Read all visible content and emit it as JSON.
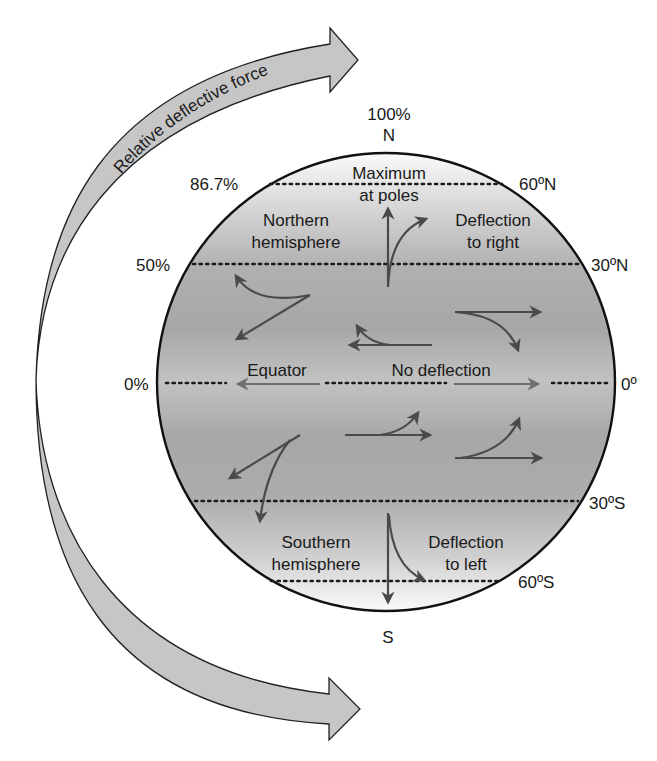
{
  "diagram": {
    "title_arrow": "Relative deflective force",
    "poles": {
      "north": "N",
      "south": "S"
    },
    "percent_labels": {
      "pole": "100%",
      "lat60": "86.7%",
      "lat30": "50%",
      "equator": "0%"
    },
    "latitude_labels": {
      "n60": "60ºN",
      "n30": "30ºN",
      "eq": "0º",
      "s30": "30ºS",
      "s60": "60ºS"
    },
    "region_labels": {
      "max_line1": "Maximum",
      "max_line2": "at poles",
      "north_line1": "Northern",
      "north_line2": "hemisphere",
      "defl_right_line1": "Deflection",
      "defl_right_line2": "to right",
      "equator": "Equator",
      "no_deflection": "No deflection",
      "south_line1": "Southern",
      "south_line2": "hemisphere",
      "defl_left_line1": "Deflection",
      "defl_left_line2": "to left"
    },
    "colors": {
      "globe_pole": "#f7f7f7",
      "globe_mid": "#a9a9a9",
      "globe_equator": "#bfbfbf",
      "arrow_fill": "#c4c4c4",
      "wind_arrow": "#4a4a4a",
      "outline": "#111111"
    },
    "deflection_scale": [
      {
        "latitude": "90ºN",
        "relative_force_pct": 100
      },
      {
        "latitude": "60º",
        "relative_force_pct": 86.7
      },
      {
        "latitude": "30º",
        "relative_force_pct": 50
      },
      {
        "latitude": "0º",
        "relative_force_pct": 0
      }
    ]
  }
}
